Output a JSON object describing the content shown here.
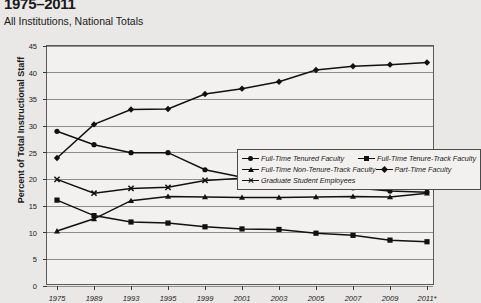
{
  "header": {
    "title": "1975–2011",
    "subtitle": "All Institutions, National Totals"
  },
  "chart_data": {
    "type": "line",
    "title": "1975–2011",
    "subtitle": "All Institutions, National Totals",
    "xlabel": "",
    "ylabel": "Percent of Total Instructional Staff",
    "ylim": [
      0,
      45
    ],
    "ytick_step": 5,
    "yticks": [
      "0",
      "5",
      "10",
      "15",
      "20",
      "25",
      "30",
      "35",
      "40",
      "45"
    ],
    "grid": true,
    "legend_position": "inside-upper-right",
    "categories": [
      "1975",
      "1989",
      "1993",
      "1995",
      "1999",
      "2001",
      "2003",
      "2005",
      "2007",
      "2009",
      "2011*"
    ],
    "series": [
      {
        "name": "Full-Time Tenured Faculty",
        "marker": "circle",
        "color": "#111111",
        "values": [
          29.0,
          26.5,
          25.0,
          25.0,
          21.8,
          20.4,
          19.9,
          19.0,
          18.4,
          17.8,
          17.6
        ]
      },
      {
        "name": "Full-Time Tenure-Track Faculty",
        "marker": "square",
        "color": "#111111",
        "values": [
          16.1,
          13.2,
          12.0,
          11.8,
          11.1,
          10.7,
          10.6,
          9.9,
          9.5,
          8.6,
          8.3
        ]
      },
      {
        "name": "Full-Time Non-Tenure-Track Faculty",
        "marker": "triangle",
        "color": "#111111",
        "values": [
          10.3,
          12.6,
          16.0,
          16.8,
          16.7,
          16.6,
          16.6,
          16.7,
          16.8,
          16.7,
          17.4
        ]
      },
      {
        "name": "Part-Time Faculty",
        "marker": "diamond",
        "color": "#111111",
        "values": [
          24.0,
          30.3,
          33.1,
          33.2,
          36.0,
          37.0,
          38.3,
          40.5,
          41.2,
          41.5,
          41.9
        ]
      },
      {
        "name": "Graduate Student Employees",
        "marker": "x",
        "color": "#111111",
        "values": [
          20.0,
          17.4,
          18.3,
          18.5,
          19.8,
          20.2,
          19.7,
          19.6,
          19.8,
          20.0,
          20.0
        ]
      }
    ]
  }
}
